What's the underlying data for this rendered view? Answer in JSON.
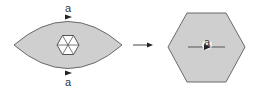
{
  "diagram": {
    "left_shape": {
      "type": "lens",
      "fill": "#cfcfcf",
      "stroke": "#666666",
      "inner_shape": {
        "type": "hexagon",
        "subdivisions": 6,
        "fill": "#ffffff",
        "stroke": "#555555"
      },
      "top_label": "a",
      "bottom_label": "a"
    },
    "transition": {
      "type": "arrow",
      "direction": "right"
    },
    "right_shape": {
      "type": "hexagon",
      "fill": "#cfcfcf",
      "stroke": "#666666",
      "center_line": true,
      "center_label": "a"
    }
  }
}
